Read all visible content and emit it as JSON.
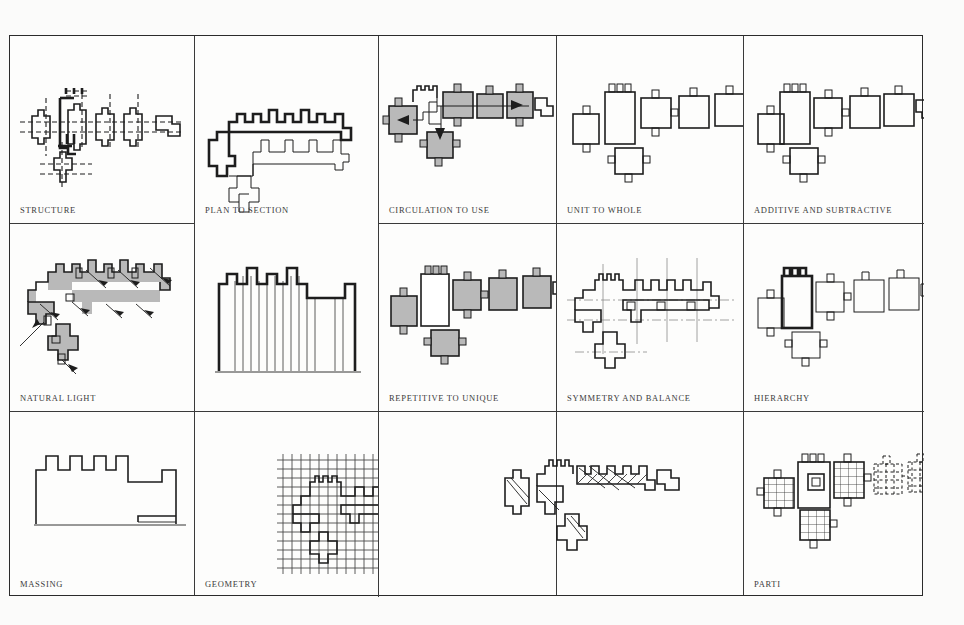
{
  "sheet": {
    "title": "Architectural Analysis Diagram Sheet",
    "background_color": "#fbfbfa",
    "border_color": "#2b2b2b",
    "ink_color": "#1d1d1d",
    "shade_color": "#b9b9b9",
    "columns": 5,
    "rows": 3
  },
  "cells": [
    {
      "id": "structure",
      "label": "STRUCTURE",
      "row": 1,
      "col": 1
    },
    {
      "id": "plan-to-section",
      "label": "PLAN TO SECTION",
      "row": 1,
      "col": 2,
      "rowspan": 2
    },
    {
      "id": "circulation-to-use",
      "label": "CIRCULATION TO USE",
      "row": 1,
      "col": 3
    },
    {
      "id": "unit-to-whole",
      "label": "UNIT TO WHOLE",
      "row": 1,
      "col": 4
    },
    {
      "id": "additive-subtractive",
      "label": "ADDITIVE AND SUBTRACTIVE",
      "row": 1,
      "col": 5
    },
    {
      "id": "natural-light",
      "label": "NATURAL LIGHT",
      "row": 2,
      "col": 1
    },
    {
      "id": "repetitive-to-unique",
      "label": "REPETITIVE TO UNIQUE",
      "row": 2,
      "col": 3
    },
    {
      "id": "symmetry-and-balance",
      "label": "SYMMETRY AND BALANCE",
      "row": 2,
      "col": 4
    },
    {
      "id": "hierarchy",
      "label": "HIERARCHY",
      "row": 2,
      "col": 5
    },
    {
      "id": "massing",
      "label": "MASSING",
      "row": 3,
      "col": 1
    },
    {
      "id": "geometry",
      "label": "GEOMETRY",
      "row": 3,
      "col": 2
    },
    {
      "id": "unlabeled-hatched",
      "label": "",
      "row": 3,
      "col": 3,
      "colspan": 2
    },
    {
      "id": "parti",
      "label": "PARTI",
      "row": 3,
      "col": 5
    }
  ],
  "labels": {
    "structure": "STRUCTURE",
    "plan_to_section": "PLAN TO SECTION",
    "circulation_to_use": "CIRCULATION TO USE",
    "unit_to_whole": "UNIT TO WHOLE",
    "additive_and_subtractive": "ADDITIVE AND SUBTRACTIVE",
    "natural_light": "NATURAL LIGHT",
    "repetitive_to_unique": "REPETITIVE TO UNIQUE",
    "symmetry_and_balance": "SYMMETRY AND BALANCE",
    "hierarchy": "HIERARCHY",
    "massing": "MASSING",
    "geometry": "GEOMETRY",
    "parti": "PARTI"
  }
}
